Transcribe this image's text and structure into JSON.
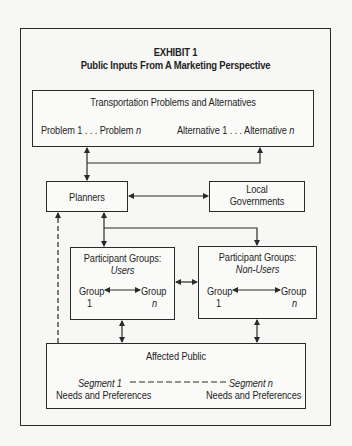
{
  "exhibit": {
    "label": "EXHIBIT  1",
    "title": "Public Inputs From A Marketing Perspective"
  },
  "nodes": {
    "transport": {
      "title": "Transportation Problems and Alternatives",
      "problem_start": "Problem 1 . . . Problem ",
      "problem_n": "n",
      "alt_start": "Alternative 1 . . . Alternative ",
      "alt_n": "n"
    },
    "planners": {
      "label": "Planners"
    },
    "local_gov": {
      "line1": "Local",
      "line2": "Governments"
    },
    "users": {
      "title": "Participant Groups:",
      "subtitle": "Users",
      "group_left": "Group",
      "group_left_num": "1",
      "group_right": "Group",
      "group_right_num": "n"
    },
    "non_users": {
      "title": "Participant Groups:",
      "subtitle": "Non-Users",
      "group_left": "Group",
      "group_left_num": "1",
      "group_right": "Group",
      "group_right_num": "n"
    },
    "public": {
      "title": "Affected Public",
      "seg_left": "Segment 1",
      "seg_right": "Segment n",
      "needs_left": "Needs and Preferences",
      "needs_right": "Needs and Preferences"
    }
  },
  "edges": [
    {
      "from": "transport",
      "to": "planners",
      "type": "bidirectional"
    },
    {
      "from": "planners",
      "to": "transport",
      "type": "arrow-via-branch"
    },
    {
      "from": "planners",
      "to": "local_gov",
      "type": "bidirectional"
    },
    {
      "from": "planners",
      "to": "users",
      "type": "bidirectional"
    },
    {
      "from": "planners",
      "to": "non_users",
      "type": "arrow-via-branch"
    },
    {
      "from": "users",
      "to": "non_users",
      "type": "bidirectional"
    },
    {
      "from": "users",
      "to": "public",
      "type": "bidirectional"
    },
    {
      "from": "non_users",
      "to": "public",
      "type": "bidirectional"
    },
    {
      "from": "public",
      "to": "planners",
      "type": "dashed-arrow"
    }
  ],
  "colors": {
    "ink": "#2a2a2a",
    "paper": "#f7f7f5"
  }
}
